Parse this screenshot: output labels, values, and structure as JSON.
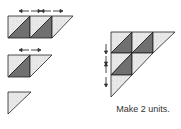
{
  "diagram": {
    "caption": "Make 2 units.",
    "colors": {
      "light": "#e6e6e6",
      "dark": "#707070",
      "stroke": "#222222",
      "arrow": "#333333"
    },
    "steps": [
      {
        "name": "row-1",
        "squares": 2,
        "end_triangle": true,
        "pressing": "arrows-left-right"
      },
      {
        "name": "row-2",
        "squares": 1,
        "end_triangle": true,
        "pressing": "arrows-left-right"
      },
      {
        "name": "row-3",
        "squares": 0,
        "end_triangle": true
      }
    ],
    "result": {
      "name": "assembled-triangle-unit",
      "rows": 3,
      "pressing": "arrows-up-down"
    }
  }
}
